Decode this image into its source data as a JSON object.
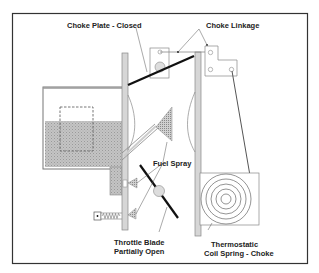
{
  "diagram": {
    "type": "carburetor-choke-system",
    "labels": {
      "choke_plate": "Choke Plate - Closed",
      "choke_linkage": "Choke Linkage",
      "fuel_spray": "Fuel Spray",
      "throttle_line1": "Throttle Blade",
      "throttle_line2": "Partially Open",
      "thermo_line1": "Thermostatic",
      "thermo_line2": "Coil Spring - Choke"
    },
    "colors": {
      "border": "#333333",
      "fuel": "#b8b8b8",
      "wall": "#d4d4d4",
      "line": "#555555",
      "blade": "#111111"
    }
  }
}
